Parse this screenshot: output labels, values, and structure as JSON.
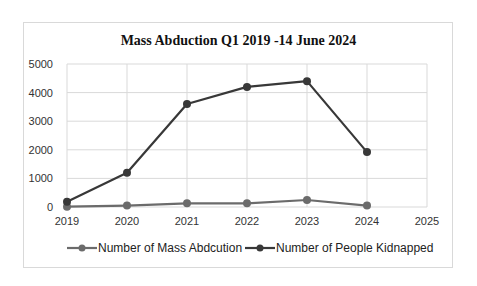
{
  "chart_data": {
    "type": "line",
    "title": "Mass Abduction  Q1 2019 -14 June 2024",
    "xlabel": "",
    "ylabel": "",
    "x": [
      2019,
      2020,
      2021,
      2022,
      2023,
      2024
    ],
    "x_ticks": [
      "2019",
      "2020",
      "2021",
      "2022",
      "2023",
      "2024",
      "2025"
    ],
    "y_ticks": [
      "0",
      "1000",
      "2000",
      "3000",
      "4000",
      "5000"
    ],
    "ylim": [
      0,
      5000
    ],
    "xlim": [
      2019,
      2025
    ],
    "grid": true,
    "legend_position": "bottom",
    "series": [
      {
        "name": "Number of Mass Abdcution",
        "color": "#6b6b6b",
        "values": [
          10,
          50,
          130,
          130,
          245,
          50
        ]
      },
      {
        "name": "Number of People Kidnapped",
        "color": "#383838",
        "values": [
          185,
          1200,
          3600,
          4200,
          4400,
          1920
        ]
      }
    ]
  },
  "legend": {
    "item_0": "Number of Mass Abdcution",
    "item_1": "Number of People Kidnapped"
  }
}
